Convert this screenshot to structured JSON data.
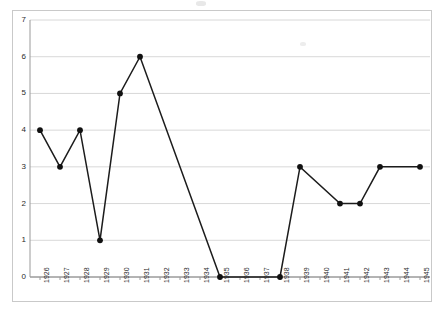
{
  "chart_data": {
    "type": "line",
    "title": "",
    "subtitle": "",
    "xlabel": "",
    "ylabel": "",
    "categories": [
      "1926",
      "1927",
      "1928",
      "1929",
      "1930",
      "1931",
      "1932",
      "1933",
      "1934",
      "1935",
      "1936",
      "1937",
      "1938",
      "1939",
      "1940",
      "1941",
      "1942",
      "1943",
      "1944",
      "1945"
    ],
    "series": [
      {
        "name": "series-1",
        "values": [
          4,
          3,
          4,
          1,
          5,
          6,
          null,
          null,
          null,
          0,
          null,
          null,
          0,
          3,
          null,
          2,
          2,
          3,
          null,
          3
        ]
      }
    ],
    "ylim": [
      0,
      7
    ],
    "ytick_labels": [
      "0",
      "1",
      "2",
      "3",
      "4",
      "5",
      "6",
      "7"
    ],
    "ytick_values": [
      0,
      1,
      2,
      3,
      4,
      5,
      6,
      7
    ],
    "grid": "horizontal",
    "legend": "none",
    "marker": "filled-circle",
    "line_color": "#1c1c1c",
    "marker_color": "#111111",
    "grid_color": "#d8d8d8",
    "axis_color": "#9a9a9a",
    "background_color": "#ffffff",
    "note": "Markers present only at years with data; gaps at 1932-1934, 1936-1937, 1940 and 1944 are spanned by straight connecting lines."
  }
}
